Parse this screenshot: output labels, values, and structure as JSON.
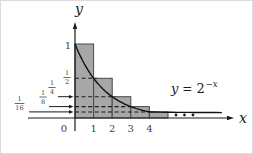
{
  "figure": {
    "axis_labels": {
      "x": "x",
      "y": "y"
    },
    "function_label": {
      "var": "y",
      "equals": "=",
      "base": "2",
      "exponent": "−x"
    },
    "origin_label": "0",
    "x_ticks": [
      "1",
      "2",
      "3",
      "4"
    ],
    "y_labels": [
      {
        "label": "1"
      },
      {
        "num": "1",
        "den": "2"
      },
      {
        "num": "1",
        "den": "4"
      },
      {
        "num": "1",
        "den": "8"
      },
      {
        "num": "1",
        "den": "16"
      }
    ]
  },
  "chart_data": {
    "type": "line",
    "title": "",
    "function": "y = 2^(-x)",
    "xlabel": "x",
    "ylabel": "y",
    "x_range_shown": [
      0,
      8
    ],
    "x_ticks": [
      0,
      1,
      2,
      3,
      4
    ],
    "curve_points": [
      [
        0,
        1
      ],
      [
        1,
        0.5
      ],
      [
        2,
        0.25
      ],
      [
        3,
        0.125
      ],
      [
        4,
        0.0625
      ],
      [
        5,
        0.03125
      ],
      [
        6,
        0.015625
      ]
    ],
    "rectangles": [
      {
        "x0": 0,
        "x1": 1,
        "height": 1
      },
      {
        "x0": 1,
        "x1": 2,
        "height": 0.5
      },
      {
        "x0": 2,
        "x1": 3,
        "height": 0.25
      },
      {
        "x0": 3,
        "x1": 4,
        "height": 0.125
      },
      {
        "x0": 4,
        "x1": 5,
        "height": 0.0625
      }
    ],
    "dashed_levels": [
      0.5,
      0.25,
      0.125,
      0.0625
    ],
    "ellipsis_dots": 3,
    "legend": "none",
    "grid": false,
    "colors": {
      "rect_fill": "#a7a7a7",
      "rect_stroke": "#474747",
      "axis": "#1a1a1a",
      "curve": "#111111",
      "text": "#424242"
    }
  }
}
